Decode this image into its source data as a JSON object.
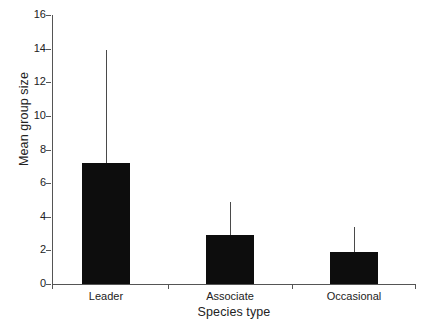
{
  "chart_data": {
    "type": "bar",
    "title": "",
    "subtitle": "",
    "xlabel": "Species type",
    "ylabel": "Mean group size",
    "categories": [
      "Leader",
      "Associate",
      "Occasional"
    ],
    "values": [
      7.2,
      2.9,
      1.9
    ],
    "error_upper": [
      13.9,
      4.9,
      3.4
    ],
    "error_type": "upper-whisker-only",
    "ylim": [
      0,
      16
    ],
    "ytick_labels": [
      "0",
      "2",
      "4",
      "6",
      "8",
      "10",
      "12",
      "14",
      "16"
    ],
    "ytick_values": [
      0,
      2,
      4,
      6,
      8,
      10,
      12,
      14,
      16
    ],
    "grid": false,
    "legend": false,
    "legend_position": "none",
    "bar_color": "#0d0d0d",
    "axis_color": "#555555",
    "background_color": "#ffffff"
  }
}
